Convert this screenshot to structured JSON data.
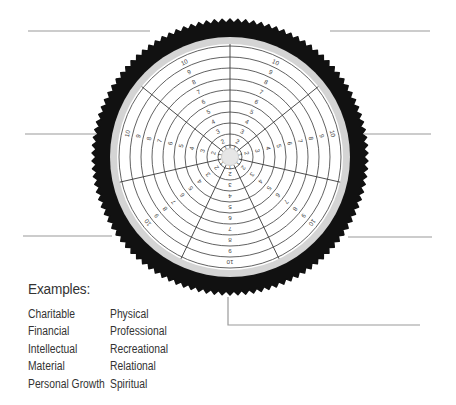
{
  "wheel": {
    "center": [
      230,
      157
    ],
    "segments": 7,
    "ring_count": 10,
    "ring_labels": [
      "1",
      "2",
      "3",
      "4",
      "5",
      "6",
      "7",
      "8",
      "9",
      "10"
    ],
    "colors": {
      "tire": "#111111",
      "rim": "#d4d4d4",
      "face": "#ffffff",
      "lines": "#3a3a3a",
      "hub": "#e6e6e6",
      "callout_lines": "#9a9a9a"
    }
  },
  "callout_lines": [
    {
      "id": "top-left",
      "points": [
        [
          28,
          31
        ],
        [
          150,
          31
        ]
      ]
    },
    {
      "id": "top-right",
      "points": [
        [
          330,
          31
        ],
        [
          430,
          31
        ]
      ]
    },
    {
      "id": "middle-left",
      "points": [
        [
          25,
          134
        ],
        [
          96,
          134
        ]
      ]
    },
    {
      "id": "middle-right",
      "points": [
        [
          364,
          134
        ],
        [
          431,
          134
        ]
      ]
    },
    {
      "id": "bottom-left",
      "points": [
        [
          23,
          236
        ],
        [
          112,
          236
        ]
      ]
    },
    {
      "id": "bottom-right",
      "points": [
        [
          348,
          237
        ],
        [
          432,
          237
        ]
      ]
    },
    {
      "id": "bottom-center",
      "points": [
        [
          228,
          297
        ],
        [
          228,
          325
        ],
        [
          420,
          325
        ]
      ]
    }
  ],
  "examples": {
    "title": "Examples:",
    "items": [
      "Charitable",
      "Physical",
      "Financial",
      "Professional",
      "Intellectual",
      "Recreational",
      "Material",
      "Relational",
      "Personal Growth",
      "Spiritual"
    ]
  }
}
